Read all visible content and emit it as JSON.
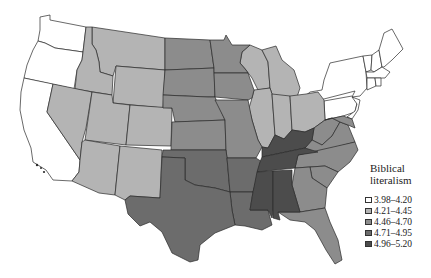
{
  "map": {
    "title": "Biblical literalism",
    "title_line1": "Biblical",
    "title_line2": "literalism",
    "region": "Contiguous United States",
    "legend": [
      {
        "label": "3.98–4.20",
        "color": "#ffffff"
      },
      {
        "label": "4.21–4.45",
        "color": "#b4b4b4"
      },
      {
        "label": "4.46–4.70",
        "color": "#8c8c8c"
      },
      {
        "label": "4.71–4.95",
        "color": "#6c6c6c"
      },
      {
        "label": "4.96–5.20",
        "color": "#4c4c4c"
      }
    ],
    "states": {
      "class_1": [
        "WA",
        "OR",
        "CA",
        "NY",
        "PA",
        "NJ",
        "VT",
        "NH",
        "ME",
        "MA",
        "CT",
        "RI"
      ],
      "class_2": [
        "MT",
        "ID",
        "WY",
        "NV",
        "UT",
        "CO",
        "AZ",
        "NM",
        "WI",
        "MI",
        "IL",
        "IN",
        "OH"
      ],
      "class_3": [
        "ND",
        "SD",
        "NE",
        "KS",
        "MN",
        "IA",
        "MO",
        "WV",
        "VA",
        "MD",
        "DE",
        "NC",
        "SC",
        "GA",
        "FL"
      ],
      "class_4": [
        "TX",
        "OK",
        "AR",
        "LA"
      ],
      "class_5": [
        "KY",
        "TN",
        "MS",
        "AL"
      ]
    }
  }
}
